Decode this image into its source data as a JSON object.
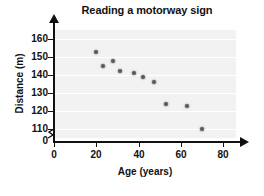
{
  "chart_data": {
    "type": "scatter",
    "title": "Reading a motorway sign",
    "xlabel": "Age (years)",
    "ylabel": "Distance (m)",
    "xlim": [
      0,
      86
    ],
    "ylim": [
      105,
      165
    ],
    "xticks": [
      0,
      20,
      40,
      60,
      80
    ],
    "yticks": [
      110,
      120,
      130,
      140,
      150,
      160
    ],
    "y_zero_label": "0",
    "y_axis_break": true,
    "grid": "horizontal",
    "legend": "none",
    "points": [
      {
        "x": 20,
        "y": 153
      },
      {
        "x": 23,
        "y": 145
      },
      {
        "x": 28,
        "y": 148
      },
      {
        "x": 31,
        "y": 142
      },
      {
        "x": 38,
        "y": 141
      },
      {
        "x": 42,
        "y": 139
      },
      {
        "x": 47,
        "y": 136
      },
      {
        "x": 53,
        "y": 124
      },
      {
        "x": 63,
        "y": 123
      },
      {
        "x": 70,
        "y": 110
      }
    ],
    "colors": {
      "plot_background": "#f2f2f2",
      "gridline": "#ffffff",
      "point": "#5a5a5a",
      "axis": "#111111",
      "text": "#111111"
    }
  }
}
